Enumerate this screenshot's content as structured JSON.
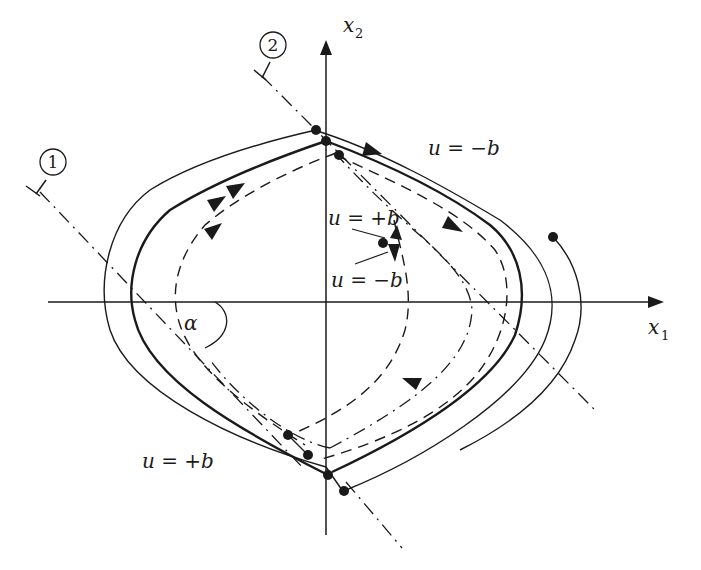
{
  "diagram": {
    "type": "phase-plane",
    "axes": {
      "horizontal": {
        "label": "x",
        "subscript": "1"
      },
      "vertical": {
        "label": "x",
        "subscript": "2"
      }
    },
    "switching_lines": [
      {
        "id": "line-1",
        "marker": "1"
      },
      {
        "id": "line-2",
        "marker": "2"
      }
    ],
    "angle_label": "α",
    "control_labels": {
      "upper_right": "u = −b",
      "inner_plus": "u = +b",
      "inner_minus": "u = −b",
      "lower_left": "u = +b"
    },
    "colors": {
      "ink": "#1a1a1a",
      "background": "#ffffff"
    }
  }
}
